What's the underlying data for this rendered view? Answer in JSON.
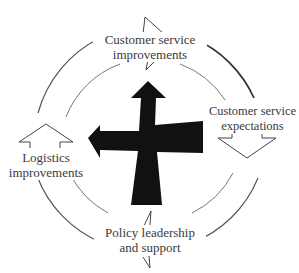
{
  "diagram": {
    "type": "cycle",
    "center_icon": "four-way-cross-arrow-icon",
    "colors": {
      "background": "#ffffff",
      "outer_ring": "#555555",
      "inner_ring": "#777777",
      "cross": "#111111",
      "text": "#3a3a3a"
    },
    "nodes": [
      {
        "id": "top",
        "line1": "Customer service",
        "line2": "improvements"
      },
      {
        "id": "right",
        "line1": "Customer service",
        "line2": "expectations"
      },
      {
        "id": "bottom",
        "line1": "Policy leadership",
        "line2": "and support"
      },
      {
        "id": "left",
        "line1": "Logistics",
        "line2": "improvements"
      }
    ],
    "flow": [
      "top",
      "right",
      "bottom",
      "left"
    ]
  }
}
